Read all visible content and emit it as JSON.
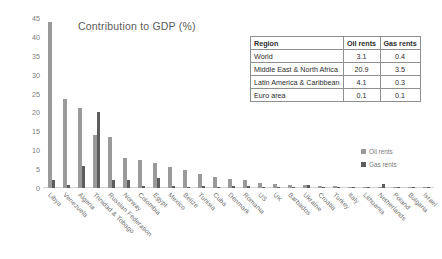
{
  "chart_data": {
    "type": "bar",
    "title": "Contribution to GDP (%)",
    "xlabel": "",
    "ylabel": "",
    "ylim": [
      0,
      45
    ],
    "yticks": [
      "0",
      "5",
      "10",
      "15",
      "20",
      "25",
      "30",
      "35",
      "40",
      "45"
    ],
    "grid": false,
    "legend_position": "right",
    "categories": [
      "Libya",
      "Venezuela",
      "Algeria",
      "Trinidad & Tobago",
      "Russian Federation",
      "Norway",
      "Colombia",
      "Egypt",
      "Mexico",
      "Belize",
      "Tunisia",
      "Cuba",
      "Denmark",
      "Romania",
      "US",
      "UK",
      "Barbados",
      "Ukraine",
      "Croatia",
      "Turkey",
      "Italy",
      "Lithuania",
      "Netherlands",
      "Poland",
      "Bulgaria",
      "Israel"
    ],
    "series": [
      {
        "name": "Oil rents",
        "color": "#9a9a9a",
        "values": [
          44.0,
          23.5,
          21.3,
          14.0,
          13.5,
          8.0,
          7.4,
          6.5,
          5.6,
          4.7,
          3.6,
          3.0,
          2.4,
          2.0,
          1.3,
          1.1,
          0.9,
          0.7,
          0.6,
          0.5,
          0.35,
          0.3,
          0.25,
          0.2,
          0.15,
          0.1
        ]
      },
      {
        "name": "Gas rents",
        "color": "#5d5d5d",
        "values": [
          2.0,
          0.7,
          5.8,
          20.0,
          2.0,
          2.0,
          0.6,
          2.6,
          0.5,
          0.3,
          0.6,
          0.1,
          0.6,
          0.5,
          0.4,
          0.3,
          0.1,
          0.9,
          0.3,
          0.2,
          0.2,
          0.1,
          1.1,
          0.2,
          0.3,
          0.1
        ]
      }
    ]
  },
  "legend": {
    "items": [
      {
        "label": "Oil rents"
      },
      {
        "label": "Gas rents"
      }
    ]
  },
  "table": {
    "headers": [
      "Region",
      "Oil rents",
      "Gas rents"
    ],
    "rows": [
      {
        "region": "World",
        "oil": "3.1",
        "gas": "0.4"
      },
      {
        "region": "Middle East & North Africa",
        "oil": "20.9",
        "gas": "3.5"
      },
      {
        "region": "Latin America & Caribbean",
        "oil": "4.1",
        "gas": "0.3"
      },
      {
        "region": "Euro area",
        "oil": "0.1",
        "gas": "0.1"
      }
    ]
  }
}
